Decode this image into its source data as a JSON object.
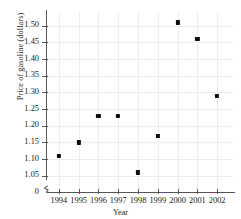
{
  "chart_data": {
    "type": "scatter",
    "title": "",
    "xlabel": "Year",
    "ylabel": "Price of gasoline (dollars)",
    "x": [
      1994,
      1995,
      1996,
      1997,
      1998,
      1999,
      2000,
      2001,
      2002
    ],
    "values": [
      1.11,
      1.15,
      1.23,
      1.23,
      1.06,
      1.17,
      1.51,
      1.46,
      1.29
    ],
    "xticklabels": [
      "1994",
      "1995",
      "1996",
      "1997",
      "1998",
      "1999",
      "2000",
      "2001",
      "2002"
    ],
    "yticklabels": [
      "1.50",
      "1.45",
      "1.40",
      "1.35",
      "1.30",
      "1.25",
      "1.20",
      "1.15",
      "1.10",
      "1.05",
      "0"
    ],
    "ytickvalues": [
      1.5,
      1.45,
      1.4,
      1.35,
      1.3,
      1.25,
      1.2,
      1.15,
      1.1,
      1.05,
      0
    ],
    "xlim": [
      1993.4,
      2002.8
    ],
    "ylim": [
      1.025,
      1.535
    ],
    "grid": true,
    "legend": null,
    "axis_break": "y-axis break between 0 and 1.05",
    "marker_color": "#0d0d0d",
    "grid_color": "#ededed",
    "axis_color": "#555555",
    "points": [
      {
        "x": "1994",
        "y": 1.11
      },
      {
        "x": "1995",
        "y": 1.15
      },
      {
        "x": "1996",
        "y": 1.23
      },
      {
        "x": "1997",
        "y": 1.23
      },
      {
        "x": "1998",
        "y": 1.06
      },
      {
        "x": "1999",
        "y": 1.17
      },
      {
        "x": "2000",
        "y": 1.51
      },
      {
        "x": "2001",
        "y": 1.46
      },
      {
        "x": "2002",
        "y": 1.29
      }
    ]
  }
}
